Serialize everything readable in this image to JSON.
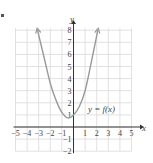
{
  "chart_data": {
    "type": "line",
    "title": "",
    "xlabel": "x",
    "ylabel": "y",
    "xlim": [
      -5,
      5
    ],
    "ylim": [
      -2,
      8
    ],
    "grid": true,
    "x_ticks": [
      -5,
      -4,
      -3,
      -2,
      -1,
      1,
      2,
      3,
      4,
      5
    ],
    "y_ticks": [
      -2,
      -1,
      1,
      2,
      3,
      4,
      5,
      6,
      7,
      8
    ],
    "x_tick_labels": [
      "−5",
      "−4",
      "−3",
      "−2",
      "−1",
      "1",
      "2",
      "3",
      "4",
      "5"
    ],
    "y_tick_labels": [
      "−2",
      "−1",
      "1",
      "2",
      "3",
      "4",
      "5",
      "6",
      "7",
      "8"
    ],
    "series": [
      {
        "name": "y = f(x)",
        "points": [
          [
            -3.1,
            8
          ],
          [
            -2.5,
            5.6
          ],
          [
            -2,
            3.6
          ],
          [
            -1.5,
            2.2
          ],
          [
            -1,
            1.2
          ],
          [
            -0.5,
            0.75
          ],
          [
            0,
            1
          ],
          [
            0.5,
            1.7
          ],
          [
            1,
            3
          ],
          [
            1.5,
            5.2
          ],
          [
            2.1,
            8
          ]
        ],
        "color": "#9a9a9a",
        "arrows_both_ends": true
      }
    ],
    "annotations": [
      {
        "text": "y = f(x)",
        "x": 1.2,
        "y": 1.8
      }
    ]
  },
  "labels": {
    "x_axis": "x",
    "y_axis": "y",
    "curve_label": "y = f(x)"
  },
  "colors": {
    "grid": "#d9d9d9",
    "axis": "#333333",
    "curve": "#9a9a9a",
    "text": "#444444"
  }
}
